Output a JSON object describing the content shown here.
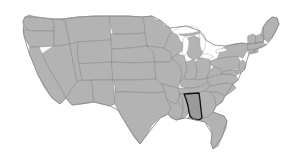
{
  "figure": {
    "kind": "choropleth-locator-map",
    "has_visible_text": false,
    "caption": "",
    "width_px": 301,
    "height_px": 163
  },
  "colors": {
    "background": "#ffffff",
    "state_fill": "#b3b3b3",
    "state_border": "#8a8a8a",
    "nation_border": "#8f8f8f",
    "highlight_fill": "#9a9a9a",
    "highlight_border": "#101010",
    "lake_fill": "#ffffff"
  },
  "map": {
    "region": "Contiguous United States",
    "projection_look": "albers-usa",
    "highlighted_state": {
      "name": "Alabama",
      "abbr": "AL",
      "fill": "#9a9a9a",
      "outline": "#101010"
    },
    "legend": [],
    "labels": [],
    "states": [
      {
        "name": "Washington",
        "abbr": "WA",
        "highlighted": false
      },
      {
        "name": "Oregon",
        "abbr": "OR",
        "highlighted": false
      },
      {
        "name": "California",
        "abbr": "CA",
        "highlighted": false
      },
      {
        "name": "Nevada",
        "abbr": "NV",
        "highlighted": false
      },
      {
        "name": "Idaho",
        "abbr": "ID",
        "highlighted": false
      },
      {
        "name": "Montana",
        "abbr": "MT",
        "highlighted": false
      },
      {
        "name": "Wyoming",
        "abbr": "WY",
        "highlighted": false
      },
      {
        "name": "Utah",
        "abbr": "UT",
        "highlighted": false
      },
      {
        "name": "Arizona",
        "abbr": "AZ",
        "highlighted": false
      },
      {
        "name": "Colorado",
        "abbr": "CO",
        "highlighted": false
      },
      {
        "name": "New Mexico",
        "abbr": "NM",
        "highlighted": false
      },
      {
        "name": "North Dakota",
        "abbr": "ND",
        "highlighted": false
      },
      {
        "name": "South Dakota",
        "abbr": "SD",
        "highlighted": false
      },
      {
        "name": "Nebraska",
        "abbr": "NE",
        "highlighted": false
      },
      {
        "name": "Kansas",
        "abbr": "KS",
        "highlighted": false
      },
      {
        "name": "Oklahoma",
        "abbr": "OK",
        "highlighted": false
      },
      {
        "name": "Texas",
        "abbr": "TX",
        "highlighted": false
      },
      {
        "name": "Minnesota",
        "abbr": "MN",
        "highlighted": false
      },
      {
        "name": "Iowa",
        "abbr": "IA",
        "highlighted": false
      },
      {
        "name": "Missouri",
        "abbr": "MO",
        "highlighted": false
      },
      {
        "name": "Arkansas",
        "abbr": "AR",
        "highlighted": false
      },
      {
        "name": "Louisiana",
        "abbr": "LA",
        "highlighted": false
      },
      {
        "name": "Wisconsin",
        "abbr": "WI",
        "highlighted": false
      },
      {
        "name": "Illinois",
        "abbr": "IL",
        "highlighted": false
      },
      {
        "name": "Michigan",
        "abbr": "MI",
        "highlighted": false
      },
      {
        "name": "Indiana",
        "abbr": "IN",
        "highlighted": false
      },
      {
        "name": "Ohio",
        "abbr": "OH",
        "highlighted": false
      },
      {
        "name": "Kentucky",
        "abbr": "KY",
        "highlighted": false
      },
      {
        "name": "Tennessee",
        "abbr": "TN",
        "highlighted": false
      },
      {
        "name": "Mississippi",
        "abbr": "MS",
        "highlighted": false
      },
      {
        "name": "Alabama",
        "abbr": "AL",
        "highlighted": true
      },
      {
        "name": "Georgia",
        "abbr": "GA",
        "highlighted": false
      },
      {
        "name": "Florida",
        "abbr": "FL",
        "highlighted": false
      },
      {
        "name": "South Carolina",
        "abbr": "SC",
        "highlighted": false
      },
      {
        "name": "North Carolina",
        "abbr": "NC",
        "highlighted": false
      },
      {
        "name": "Virginia",
        "abbr": "VA",
        "highlighted": false
      },
      {
        "name": "West Virginia",
        "abbr": "WV",
        "highlighted": false
      },
      {
        "name": "Maryland",
        "abbr": "MD",
        "highlighted": false
      },
      {
        "name": "Delaware",
        "abbr": "DE",
        "highlighted": false
      },
      {
        "name": "Pennsylvania",
        "abbr": "PA",
        "highlighted": false
      },
      {
        "name": "New Jersey",
        "abbr": "NJ",
        "highlighted": false
      },
      {
        "name": "New York",
        "abbr": "NY",
        "highlighted": false
      },
      {
        "name": "Connecticut",
        "abbr": "CT",
        "highlighted": false
      },
      {
        "name": "Rhode Island",
        "abbr": "RI",
        "highlighted": false
      },
      {
        "name": "Massachusetts",
        "abbr": "MA",
        "highlighted": false
      },
      {
        "name": "Vermont",
        "abbr": "VT",
        "highlighted": false
      },
      {
        "name": "New Hampshire",
        "abbr": "NH",
        "highlighted": false
      },
      {
        "name": "Maine",
        "abbr": "ME",
        "highlighted": false
      }
    ],
    "water_bodies": [
      {
        "name": "Lake Superior"
      },
      {
        "name": "Lake Michigan"
      },
      {
        "name": "Lake Huron"
      },
      {
        "name": "Lake Erie"
      },
      {
        "name": "Lake Ontario"
      }
    ]
  }
}
